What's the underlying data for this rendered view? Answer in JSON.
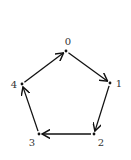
{
  "diagram": {
    "type": "directed-cycle-graph",
    "colors": {
      "edge": "#111111",
      "label": "#333333",
      "background": "#ffffff"
    },
    "nodes": [
      {
        "id": "0",
        "label": "0",
        "x": 66,
        "y": 51,
        "lx": 68,
        "ly": 45
      },
      {
        "id": "1",
        "label": "1",
        "x": 110,
        "y": 83,
        "lx": 119,
        "ly": 87
      },
      {
        "id": "2",
        "label": "2",
        "x": 94,
        "y": 134,
        "lx": 101,
        "ly": 146
      },
      {
        "id": "3",
        "label": "3",
        "x": 39,
        "y": 134,
        "lx": 32,
        "ly": 146
      },
      {
        "id": "4",
        "label": "4",
        "x": 22,
        "y": 84,
        "lx": 14,
        "ly": 88
      }
    ],
    "edges": [
      {
        "from": "0",
        "to": "1"
      },
      {
        "from": "1",
        "to": "2"
      },
      {
        "from": "2",
        "to": "3"
      },
      {
        "from": "3",
        "to": "4"
      },
      {
        "from": "4",
        "to": "0"
      }
    ]
  }
}
